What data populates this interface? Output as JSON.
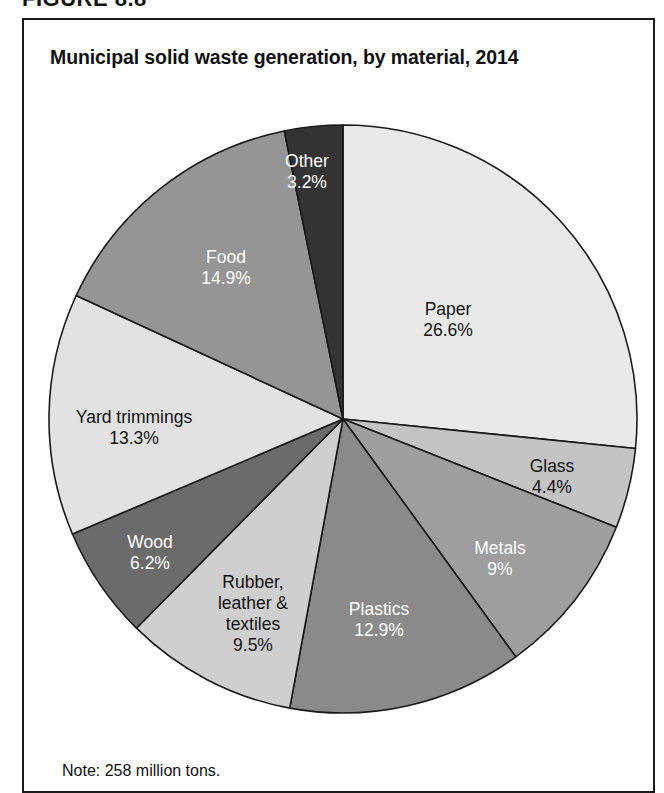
{
  "figure": {
    "number_label": "FIGURE 8.8",
    "title": "Municipal solid waste generation, by material, 2014",
    "note": "Note: 258 million tons."
  },
  "chart_data": {
    "type": "pie",
    "title": "Municipal solid waste generation, by material, 2014",
    "subtitle": "",
    "xlabel": "",
    "ylabel": "",
    "note": "Note: 258 million tons.",
    "total_label": "258 million tons",
    "units": "percent of total generation",
    "start_angle_deg": 0,
    "direction": "clockwise",
    "legend": "none (labels drawn inside slices)",
    "categories": [
      "Paper",
      "Glass",
      "Metals",
      "Plastics",
      "Rubber, leather & textiles",
      "Wood",
      "Yard trimmings",
      "Food",
      "Other"
    ],
    "values": [
      26.6,
      4.4,
      9,
      12.9,
      9.5,
      6.2,
      13.3,
      14.9,
      3.2
    ],
    "value_labels": [
      "26.6%",
      "4.4%",
      "9%",
      "12.9%",
      "9.5%",
      "6.2%",
      "13.3%",
      "14.9%",
      "3.2%"
    ],
    "slices": [
      {
        "name": "Paper",
        "label_lines": [
          "Paper",
          "26.6%"
        ],
        "value": 26.6,
        "value_label": "26.6%",
        "color": "#e9e9e9",
        "text_color": "#111111",
        "label_x": 448,
        "label_y": 320
      },
      {
        "name": "Glass",
        "label_lines": [
          "Glass",
          "4.4%"
        ],
        "value": 4.4,
        "value_label": "4.4%",
        "color": "#c4c4c4",
        "text_color": "#111111",
        "label_x": 552,
        "label_y": 477
      },
      {
        "name": "Metals",
        "label_lines": [
          "Metals",
          "9%"
        ],
        "value": 9,
        "value_label": "9%",
        "color": "#9e9e9e",
        "text_color": "#ffffff",
        "label_x": 500,
        "label_y": 559
      },
      {
        "name": "Plastics",
        "label_lines": [
          "Plastics",
          "12.9%"
        ],
        "value": 12.9,
        "value_label": "12.9%",
        "color": "#8a8a8a",
        "text_color": "#ffffff",
        "label_x": 379,
        "label_y": 620
      },
      {
        "name": "Rubber, leather & textiles",
        "label_lines": [
          "Rubber,",
          "leather &",
          "textiles",
          "9.5%"
        ],
        "value": 9.5,
        "value_label": "9.5%",
        "color": "#cfcfcf",
        "text_color": "#111111",
        "label_x": 253,
        "label_y": 614
      },
      {
        "name": "Wood",
        "label_lines": [
          "Wood",
          "6.2%"
        ],
        "value": 6.2,
        "value_label": "6.2%",
        "color": "#6b6b6b",
        "text_color": "#ffffff",
        "label_x": 150,
        "label_y": 553
      },
      {
        "name": "Yard trimmings",
        "label_lines": [
          "Yard trimmings",
          "13.3%"
        ],
        "value": 13.3,
        "value_label": "13.3%",
        "color": "#e2e2e2",
        "text_color": "#111111",
        "label_x": 134,
        "label_y": 428
      },
      {
        "name": "Food",
        "label_lines": [
          "Food",
          "14.9%"
        ],
        "value": 14.9,
        "value_label": "14.9%",
        "color": "#959595",
        "text_color": "#ffffff",
        "label_x": 226,
        "label_y": 268
      },
      {
        "name": "Other",
        "label_lines": [
          "Other",
          "3.2%"
        ],
        "value": 3.2,
        "value_label": "3.2%",
        "color": "#333333",
        "text_color": "#ffffff",
        "label_x": 307,
        "label_y": 172
      }
    ],
    "geometry": {
      "center_x": 343,
      "center_y": 419,
      "radius": 294,
      "stroke": "#1a1a1a",
      "stroke_width": 1.6
    }
  }
}
